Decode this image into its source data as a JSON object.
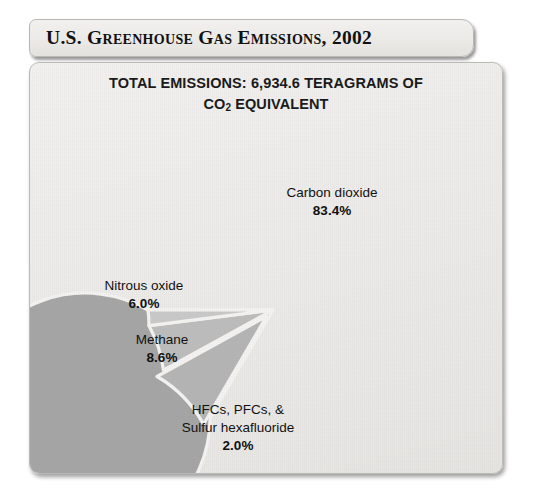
{
  "header": {
    "title": "U.S. Greenhouse Gas Emissions, 2002"
  },
  "chart_panel": {
    "subtitle_line1": "TOTAL EMISSIONS: 6,934.6 TERAGRAMS OF",
    "subtitle_line2_pre": "CO",
    "subtitle_line2_sub": "2",
    "subtitle_line2_post": " EQUIVALENT"
  },
  "labels": {
    "carbon_dioxide": {
      "name": "Carbon dioxide",
      "pct": "83.4%"
    },
    "nitrous_oxide": {
      "name": "Nitrous oxide",
      "pct": "6.0%"
    },
    "methane": {
      "name": "Methane",
      "pct": "8.6%"
    },
    "fluorinated": {
      "line1": "HFCs, PFCs, &",
      "line2": "Sulfur hexafluoride",
      "pct": "2.0%"
    }
  },
  "colors": {
    "slice_carbon_dioxide": "#a6a6a6",
    "slice_methane": "#b5b5b5",
    "slice_nitrous_oxide": "#bdbdbd",
    "slice_fluorinated": "#c9c9c9",
    "panel_background": "#eeecea",
    "separator": "#f4f3f1",
    "text": "#111111"
  },
  "chart_data": {
    "type": "pie",
    "title": "U.S. Greenhouse Gas Emissions, 2002",
    "subtitle": "TOTAL EMISSIONS: 6,934.6 TERAGRAMS OF CO2 EQUIVALENT",
    "total_value": 6934.6,
    "total_units": "teragrams of CO2 equivalent",
    "categories": [
      "Carbon dioxide",
      "Methane",
      "Nitrous oxide",
      "HFCs, PFCs, & Sulfur hexafluoride"
    ],
    "values": [
      83.4,
      8.6,
      6.0,
      2.0
    ],
    "value_units": "percent",
    "labels_shown": [
      "Carbon dioxide 83.4%",
      "Methane 8.6%",
      "Nitrous oxide 6.0%",
      "HFCs, PFCs, & Sulfur hexafluoride 2.0%"
    ],
    "exploded_slices": [
      "Methane"
    ],
    "start_angle_deg": 180,
    "direction": "counterclockwise",
    "legend": "none",
    "grid": false
  }
}
